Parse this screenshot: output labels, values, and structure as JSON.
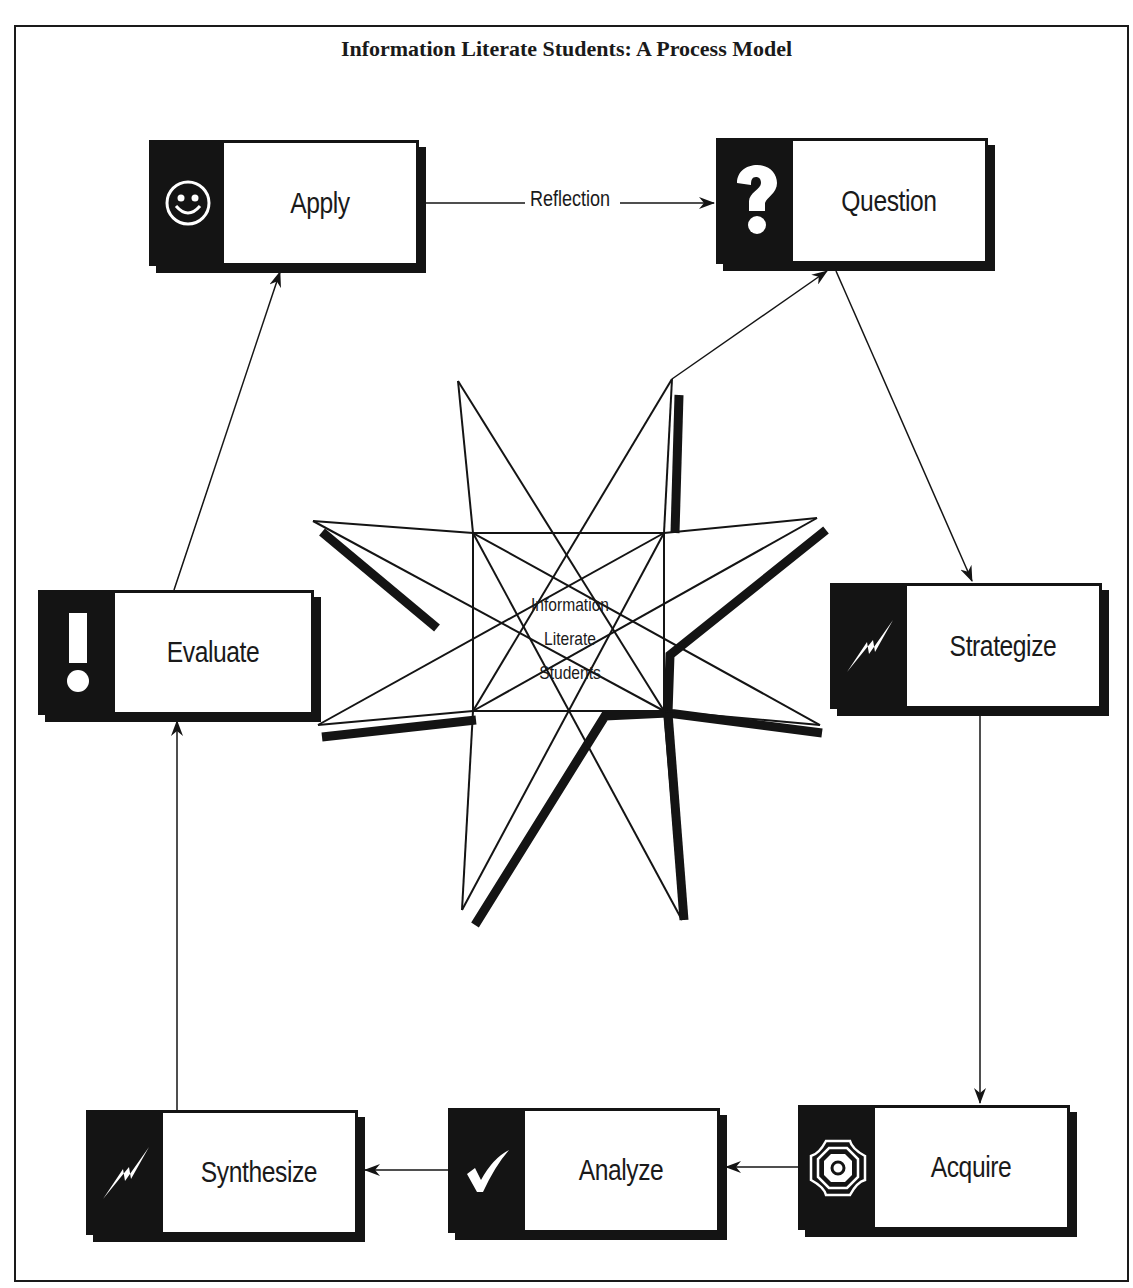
{
  "title": "Information Literate Students: A Process Model",
  "center": {
    "line1": "Information",
    "line2": "Literate",
    "line3": "Students"
  },
  "edge_label": "Reflection",
  "nodes": [
    {
      "id": "apply",
      "label": "Apply",
      "icon": "smiley-face-icon"
    },
    {
      "id": "question",
      "label": "Question",
      "icon": "question-mark-icon"
    },
    {
      "id": "strategize",
      "label": "Strategize",
      "icon": "lightning-bolt-icon"
    },
    {
      "id": "acquire",
      "label": "Acquire",
      "icon": "octagon-target-icon"
    },
    {
      "id": "analyze",
      "label": "Analyze",
      "icon": "checkmark-icon"
    },
    {
      "id": "synthesize",
      "label": "Synthesize",
      "icon": "lightning-bolt-icon"
    },
    {
      "id": "evaluate",
      "label": "Evaluate",
      "icon": "exclamation-mark-icon"
    }
  ],
  "edges": [
    {
      "from": "apply",
      "to": "question",
      "label": "Reflection"
    },
    {
      "from": "center",
      "to": "question"
    },
    {
      "from": "question",
      "to": "strategize"
    },
    {
      "from": "strategize",
      "to": "acquire"
    },
    {
      "from": "acquire",
      "to": "analyze"
    },
    {
      "from": "analyze",
      "to": "synthesize"
    },
    {
      "from": "synthesize",
      "to": "evaluate"
    },
    {
      "from": "evaluate",
      "to": "apply"
    }
  ],
  "colors": {
    "ink": "#141414",
    "background": "#ffffff"
  }
}
